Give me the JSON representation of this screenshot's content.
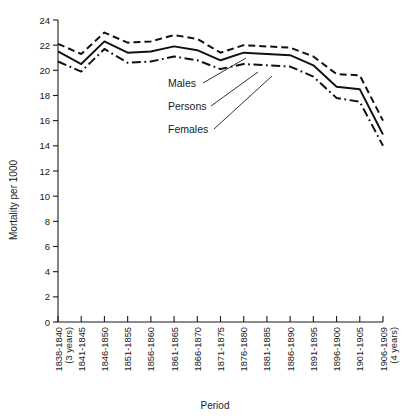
{
  "chart_data": {
    "type": "line",
    "title": "",
    "xlabel": "Period",
    "ylabel": "Mortality per 1000",
    "ylim": [
      0,
      24
    ],
    "yticks": [
      0,
      2,
      4,
      6,
      8,
      10,
      12,
      14,
      16,
      18,
      20,
      22,
      24
    ],
    "grid": false,
    "legend_position": "inline-annotations",
    "categories": [
      "1838-1840",
      "1841-1845",
      "1846-1850",
      "1851-1855",
      "1856-1860",
      "1861-1865",
      "1866-1870",
      "1871-1875",
      "1876-1880",
      "1881-1885",
      "1886-1890",
      "1891-1895",
      "1896-1900",
      "1901-1905",
      "1906-1909"
    ],
    "category_sublabels": [
      "(3 years)",
      "",
      "",
      "",
      "",
      "",
      "",
      "",
      "",
      "",
      "",
      "",
      "",
      "",
      "(4 years)"
    ],
    "series": [
      {
        "name": "Males",
        "style": "dashed",
        "values": [
          22.1,
          21.3,
          23.0,
          22.2,
          22.3,
          22.8,
          22.5,
          21.4,
          22.0,
          21.9,
          21.8,
          21.1,
          19.7,
          19.6,
          16.0
        ]
      },
      {
        "name": "Persons",
        "style": "solid",
        "values": [
          21.5,
          20.5,
          22.3,
          21.4,
          21.5,
          21.9,
          21.6,
          20.8,
          21.4,
          21.3,
          21.2,
          20.4,
          18.7,
          18.5,
          14.9
        ]
      },
      {
        "name": "Females",
        "style": "dashdot",
        "values": [
          20.7,
          19.9,
          21.7,
          20.6,
          20.7,
          21.1,
          20.8,
          20.1,
          20.5,
          20.4,
          20.3,
          19.5,
          17.8,
          17.5,
          14.0
        ]
      }
    ]
  },
  "annotations": {
    "males_label": "Males",
    "persons_label": "Persons",
    "females_label": "Females"
  },
  "colors": {
    "line": "#111111",
    "axis": "#1a1a1a",
    "background": "#ffffff"
  }
}
